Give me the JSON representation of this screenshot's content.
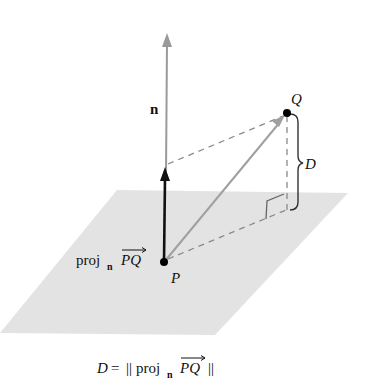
{
  "diagram": {
    "labels": {
      "normal": "n",
      "point_q": "Q",
      "point_p": "P",
      "distance": "D",
      "proj_prefix": "proj",
      "proj_sub": "n",
      "proj_vec": "PQ"
    },
    "formula": {
      "lhs": "D",
      "equals": "=",
      "norm_open": "||",
      "proj": "proj",
      "proj_sub": "n",
      "vec": "PQ",
      "norm_close": "||"
    },
    "colors": {
      "plane": "#e3e3e3",
      "normal_vector": "#9a9a9a",
      "projection_vector": "#111111",
      "pq_vector": "#a0a0a0",
      "dashed": "#8a8a8a",
      "points": "#000000"
    }
  }
}
